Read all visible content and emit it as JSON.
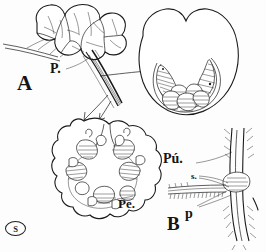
{
  "figure": {
    "background_color": "#fdfdfd",
    "ink_color": "#1a1a1a",
    "panels": [
      {
        "id": "A",
        "label": "A",
        "description": "Inflorescence cluster with branching peduncle and two pointer arrows"
      },
      {
        "id": "B",
        "label": "B",
        "description": "Detail of hairy stem node with ciliate leaf sheath"
      }
    ],
    "labels": [
      {
        "name": "panel-a-label",
        "text": "A"
      },
      {
        "name": "peduncle-label",
        "text": "P."
      },
      {
        "name": "perianth-label",
        "text": "Pe."
      },
      {
        "name": "pubescence-label",
        "text": "Pú."
      },
      {
        "name": "seta-label",
        "text": "s."
      },
      {
        "name": "pedicel-label",
        "text": "p"
      },
      {
        "name": "panel-b-label",
        "text": "B"
      },
      {
        "name": "artist-signature",
        "text": "S"
      }
    ],
    "sections": {
      "upper_right": {
        "name": "bilobed-cross-section",
        "description": "Heart shaped cross section with notch at apex and arc of hatched segments"
      },
      "lower_left": {
        "name": "circular-cross-section",
        "description": "Rounded cross section with ring of hatched wedge bodies"
      }
    }
  }
}
